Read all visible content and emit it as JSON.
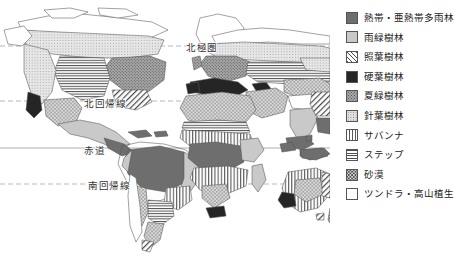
{
  "map": {
    "title": "世界の植生分布図",
    "latitude_labels": [
      {
        "id": "arctic",
        "text": "北極圏",
        "line_style": "dashed"
      },
      {
        "id": "cancer",
        "text": "北回帰線",
        "line_style": "dashed"
      },
      {
        "id": "equator",
        "text": "赤道",
        "line_style": "solid"
      },
      {
        "id": "capricorn",
        "text": "南回帰線",
        "line_style": "dashed"
      }
    ],
    "projection": "world-outline",
    "background_color": "#ffffff",
    "outline_color": "#555555"
  },
  "legend": {
    "items": [
      {
        "label": "熱帯・亜熱帯多雨林",
        "pattern": "solid-dark-gray",
        "swatch_class": "sw-tropical",
        "color": "#6e6e6e"
      },
      {
        "label": "雨緑樹林",
        "pattern": "solid-light-gray",
        "swatch_class": "sw-raingreen",
        "color": "#c9c9c9"
      },
      {
        "label": "照葉樹林",
        "pattern": "diagonal-hatch",
        "swatch_class": "sw-laurel",
        "color": "#4a4a4a"
      },
      {
        "label": "硬葉樹林",
        "pattern": "solid-black",
        "swatch_class": "sw-hardleaf",
        "color": "#252525"
      },
      {
        "label": "夏緑樹林",
        "pattern": "dense-stipple",
        "swatch_class": "sw-summergreen",
        "color": "#a8a8a8"
      },
      {
        "label": "針葉樹林",
        "pattern": "fine-stipple",
        "swatch_class": "sw-conifer",
        "color": "#e2e2e2"
      },
      {
        "label": "サバンナ",
        "pattern": "vertical-stripes",
        "swatch_class": "sw-savanna",
        "color": "#5a5a5a"
      },
      {
        "label": "ステップ",
        "pattern": "horizontal-stripes",
        "swatch_class": "sw-steppe",
        "color": "#4f4f4f"
      },
      {
        "label": "砂漠",
        "pattern": "coarse-dots",
        "swatch_class": "sw-desert",
        "color": "#d6d6d6"
      },
      {
        "label": "ツンドラ・高山植生",
        "pattern": "blank-white",
        "swatch_class": "sw-tundra",
        "color": "#ffffff"
      }
    ]
  }
}
